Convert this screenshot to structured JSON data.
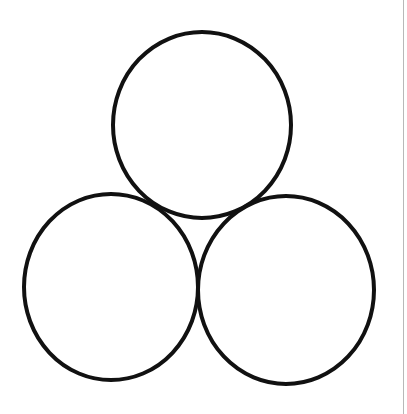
{
  "diagram": {
    "type": "three-circle-cluster",
    "stroke_color": "#111111",
    "stroke_width": 4,
    "fill_color": "#ffffff",
    "background": "#ffffff",
    "edge_line_color": "#b8b8b8",
    "circles": [
      {
        "id": "top",
        "cx": 202,
        "cy": 125,
        "rx": 89,
        "ry": 93
      },
      {
        "id": "bottom-left",
        "cx": 111,
        "cy": 287,
        "rx": 87,
        "ry": 93
      },
      {
        "id": "bottom-right",
        "cx": 286,
        "cy": 290,
        "rx": 88,
        "ry": 94
      }
    ]
  }
}
